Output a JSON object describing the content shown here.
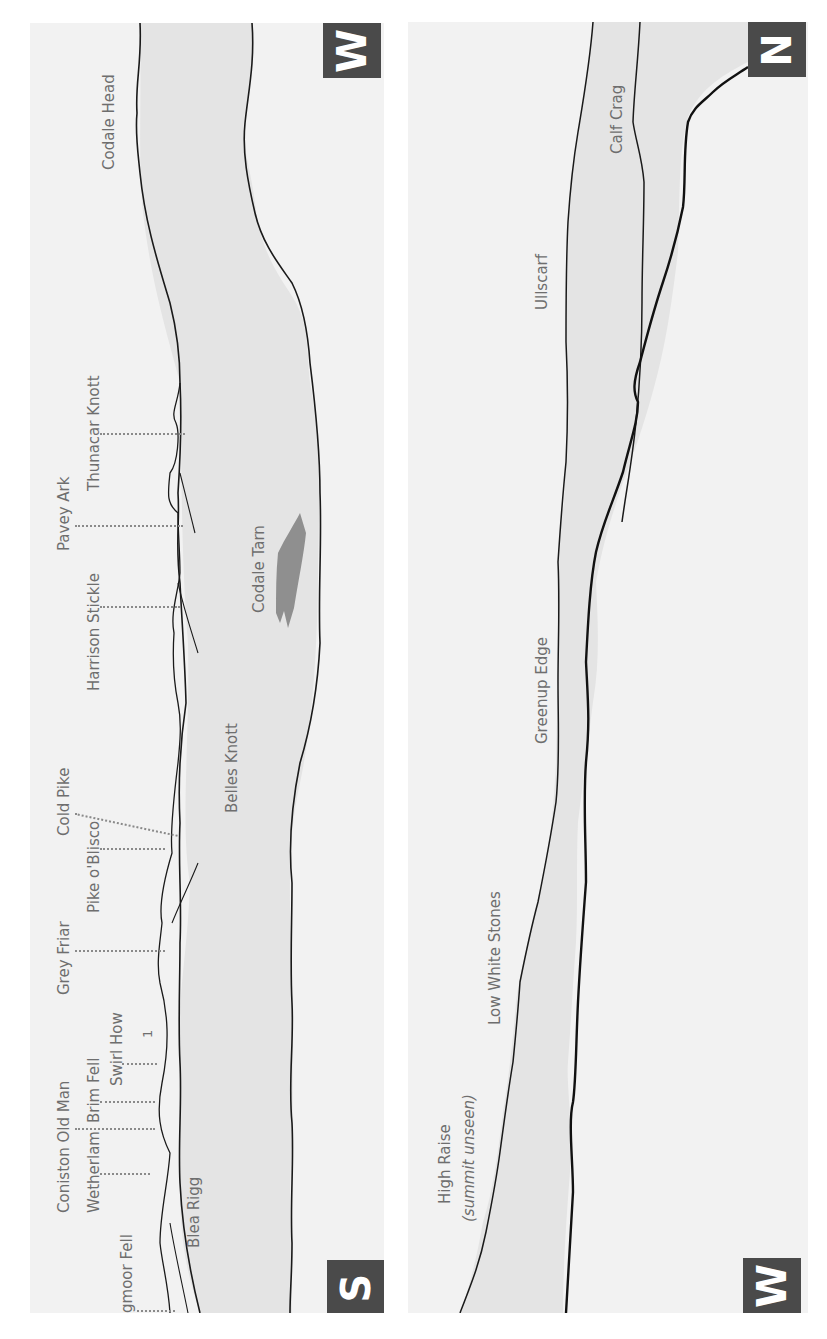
{
  "page": {
    "header_text": ""
  },
  "panels": [
    {
      "id": "left",
      "compass_top": "W",
      "compass_bottom": "S",
      "summit_labels": [
        {
          "name": "Lingmoor Fell"
        },
        {
          "name": "Wetherlam"
        },
        {
          "name": "Coniston Old Man"
        },
        {
          "name": "Brim Fell"
        },
        {
          "name": "Swirl How"
        },
        {
          "name": "Grey Friar"
        },
        {
          "name": "Pike o'Blisco"
        },
        {
          "name": "Cold Pike"
        },
        {
          "name": "Harrison Stickle"
        },
        {
          "name": "Pavey Ark"
        },
        {
          "name": "Thunacar Knott"
        }
      ],
      "area_labels": [
        {
          "name": "Blea Rigg"
        },
        {
          "name": "Belles Knott"
        },
        {
          "name": "Codale Tarn"
        },
        {
          "name": "Codale Head"
        }
      ],
      "marker": "1"
    },
    {
      "id": "right",
      "compass_top": "N",
      "compass_bottom": "W",
      "area_labels": [
        {
          "name": "High Raise"
        },
        {
          "name": "(summit unseen)"
        },
        {
          "name": "Low White Stones"
        },
        {
          "name": "Greenup Edge"
        },
        {
          "name": "Ullscarf"
        },
        {
          "name": "Calf Crag"
        }
      ]
    }
  ],
  "colors": {
    "panel_bg": "#f2f2f2",
    "ridge_fill": "#e4e4e4",
    "line": "#1a1a1a",
    "label": "#6e6e6e",
    "compass_bg": "#4a4a4a",
    "tarn": "#808080"
  }
}
